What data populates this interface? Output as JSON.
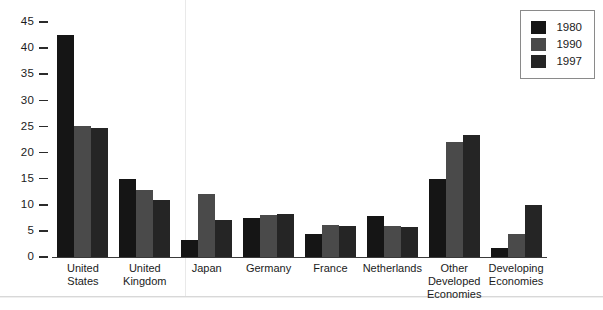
{
  "chart_data": {
    "type": "bar",
    "title": "",
    "xlabel": "",
    "ylabel": "",
    "ylim": [
      0,
      45
    ],
    "yticks": [
      0,
      5,
      10,
      15,
      20,
      25,
      30,
      35,
      40,
      45
    ],
    "grid": false,
    "legend_position": "top-right",
    "categories": [
      "United States",
      "United Kingdom",
      "Japan",
      "Germany",
      "France",
      "Netherlands",
      "Other Developed Economies",
      "Developing Economies"
    ],
    "category_lines": [
      [
        "United",
        "States"
      ],
      [
        "United",
        "Kingdom"
      ],
      [
        "Japan"
      ],
      [
        "Germany"
      ],
      [
        "France"
      ],
      [
        "Netherlands"
      ],
      [
        "Other",
        "Developed",
        "Economies"
      ],
      [
        "Developing",
        "Economies"
      ]
    ],
    "series": [
      {
        "name": "1980",
        "color": "#151515",
        "values": [
          42.5,
          15.0,
          3.3,
          7.5,
          4.5,
          7.8,
          15.0,
          1.7
        ]
      },
      {
        "name": "1990",
        "color": "#4a4a4a",
        "values": [
          25.0,
          12.8,
          12.0,
          8.0,
          6.2,
          6.0,
          22.0,
          4.5
        ]
      },
      {
        "name": "1997",
        "color": "#252525",
        "values": [
          24.8,
          11.0,
          7.0,
          8.2,
          5.9,
          5.7,
          23.3,
          10.0
        ]
      }
    ]
  },
  "legend": {
    "entries": [
      {
        "label": "1980"
      },
      {
        "label": "1990"
      },
      {
        "label": "1997"
      }
    ]
  }
}
